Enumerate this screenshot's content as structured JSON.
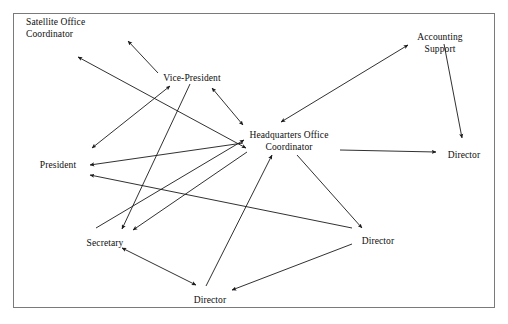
{
  "figure": {
    "kind": "network-diagram",
    "border_color": "#7a7a7a",
    "edge_color": "#1a1a1a",
    "text_color": "#0d0d0d",
    "background": "#ffffff",
    "frame": {
      "x": 13,
      "y": 13,
      "width": 481,
      "height": 294
    }
  },
  "nodes": [
    {
      "id": "satellite",
      "label": "Satellite Office\nCoordinator",
      "x": 26,
      "y": 17,
      "align": "left"
    },
    {
      "id": "vice_president",
      "label": "Vice-President",
      "x": 192,
      "y": 73,
      "align": "center"
    },
    {
      "id": "accounting",
      "label": "Accounting Support",
      "x": 440,
      "y": 32,
      "align": "center"
    },
    {
      "id": "headquarters",
      "label": "Headquarters Office\nCoordinator",
      "x": 289,
      "y": 130,
      "align": "center"
    },
    {
      "id": "director_right",
      "label": "Director",
      "x": 464,
      "y": 150,
      "align": "center"
    },
    {
      "id": "president",
      "label": "President",
      "x": 58,
      "y": 160,
      "align": "center"
    },
    {
      "id": "secretary",
      "label": "Secretary",
      "x": 105,
      "y": 238,
      "align": "center"
    },
    {
      "id": "director_mid",
      "label": "Director",
      "x": 378,
      "y": 236,
      "align": "center"
    },
    {
      "id": "director_bottom",
      "label": "Director",
      "x": 210,
      "y": 295,
      "align": "center"
    }
  ],
  "edges": [
    {
      "from": "vice_president",
      "to": "satellite",
      "heads": "one",
      "x1": 158,
      "y1": 73,
      "x2": 128,
      "y2": 41
    },
    {
      "from": "satellite",
      "to": "headquarters",
      "heads": "double",
      "x1": 78,
      "y1": 57,
      "x2": 246,
      "y2": 148
    },
    {
      "from": "president",
      "to": "vice_president",
      "heads": "double",
      "x1": 92,
      "y1": 148,
      "x2": 170,
      "y2": 86
    },
    {
      "from": "headquarters",
      "to": "vice_president",
      "heads": "double",
      "x1": 243,
      "y1": 125,
      "x2": 212,
      "y2": 88
    },
    {
      "from": "vice_president",
      "to": "secretary",
      "heads": "one",
      "x1": 190,
      "y1": 84,
      "x2": 122,
      "y2": 229
    },
    {
      "from": "headquarters",
      "to": "accounting",
      "heads": "double",
      "x1": 281,
      "y1": 122,
      "x2": 408,
      "y2": 45
    },
    {
      "from": "accounting",
      "to": "director_right",
      "heads": "one",
      "x1": 444,
      "y1": 44,
      "x2": 462,
      "y2": 138
    },
    {
      "from": "headquarters",
      "to": "director_right",
      "heads": "one",
      "x1": 340,
      "y1": 150,
      "x2": 436,
      "y2": 152
    },
    {
      "from": "headquarters",
      "to": "president",
      "heads": "one",
      "x1": 243,
      "y1": 143,
      "x2": 90,
      "y2": 165
    },
    {
      "from": "director_mid",
      "to": "president",
      "heads": "one",
      "x1": 352,
      "y1": 228,
      "x2": 90,
      "y2": 175
    },
    {
      "from": "headquarters",
      "to": "secretary",
      "heads": "one",
      "x1": 247,
      "y1": 152,
      "x2": 133,
      "y2": 230
    },
    {
      "from": "secretary",
      "to": "headquarters",
      "heads": "one",
      "x1": 96,
      "y1": 228,
      "x2": 244,
      "y2": 140
    },
    {
      "from": "director_bottom",
      "to": "headquarters",
      "heads": "one",
      "x1": 206,
      "y1": 286,
      "x2": 272,
      "y2": 155
    },
    {
      "from": "headquarters",
      "to": "director_mid",
      "heads": "one",
      "x1": 297,
      "y1": 155,
      "x2": 362,
      "y2": 228
    },
    {
      "from": "secretary",
      "to": "director_bottom",
      "heads": "double",
      "x1": 122,
      "y1": 248,
      "x2": 196,
      "y2": 285
    },
    {
      "from": "director_mid",
      "to": "director_bottom",
      "heads": "one",
      "x1": 352,
      "y1": 244,
      "x2": 232,
      "y2": 290
    }
  ]
}
